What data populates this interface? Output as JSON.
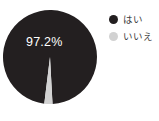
{
  "chart_data": {
    "type": "pie",
    "title": "",
    "categories": [
      "はい",
      "いいえ"
    ],
    "values": [
      97.2,
      2.8
    ],
    "value_labels": [
      "97.2%",
      ""
    ],
    "colors": [
      "#231f20",
      "#d2d2d2"
    ],
    "units": "%",
    "legend_position": "right",
    "grid": false,
    "start_angle_deg": 0,
    "slices": [
      {
        "name": "はい",
        "value": 97.2,
        "display": "97.2%",
        "color": "#231f20",
        "label_shown": true
      },
      {
        "name": "いいえ",
        "value": 2.8,
        "display": "2.8%",
        "color": "#d2d2d2",
        "label_shown": false
      }
    ]
  },
  "chart": {
    "center_x": 50,
    "center_y": 57,
    "radius": 47,
    "label_text": "97.2%",
    "label_x": 26,
    "label_y": 36
  },
  "legend": {
    "items": [
      {
        "label": "はい",
        "color": "#231f20"
      },
      {
        "label": "いいえ",
        "color": "#d2d2d2"
      }
    ]
  },
  "background": "#ffffff"
}
